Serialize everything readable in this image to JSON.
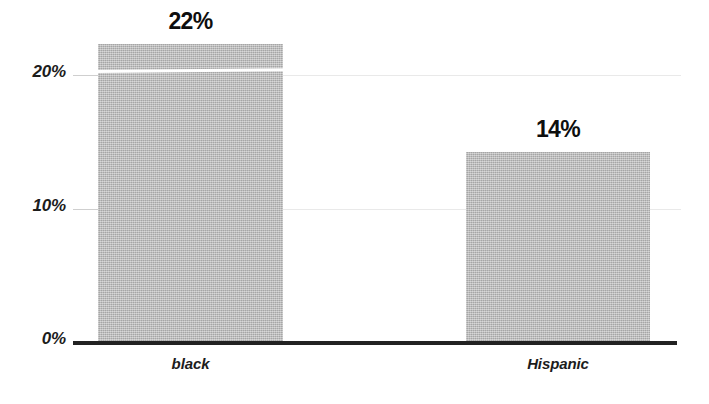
{
  "chart_data": {
    "type": "bar",
    "title": "",
    "subtitle": "",
    "xlabel": "",
    "ylabel": "",
    "categories": [
      "black",
      "Hispanic"
    ],
    "values": [
      22,
      14
    ],
    "value_labels": [
      "22%",
      "14%"
    ],
    "ylim": [
      0,
      22
    ],
    "yticks": [
      0,
      10,
      20
    ],
    "ytick_labels": [
      "0%",
      "10%",
      "20%"
    ],
    "grid": true,
    "grid_axis": "y",
    "legend": false,
    "legend_position": "none",
    "series": [
      {
        "name": "",
        "values": [
          22,
          14
        ]
      }
    ],
    "bar_color": "#b6b6b6",
    "axis_color": "#222222",
    "gridline_color": "#e9e9e9",
    "label_color": "#0e0e0e"
  },
  "axis": {
    "y": {
      "ticks": [
        {
          "label": "20%",
          "value": 20
        },
        {
          "label": "10%",
          "value": 10
        },
        {
          "label": "0%",
          "value": 0
        }
      ]
    },
    "x": {
      "ticks": [
        {
          "label": "black"
        },
        {
          "label": "Hispanic"
        }
      ]
    }
  },
  "bars": [
    {
      "category": "black",
      "value": 22,
      "label": "22%"
    },
    {
      "category": "Hispanic",
      "value": 14,
      "label": "14%"
    }
  ]
}
